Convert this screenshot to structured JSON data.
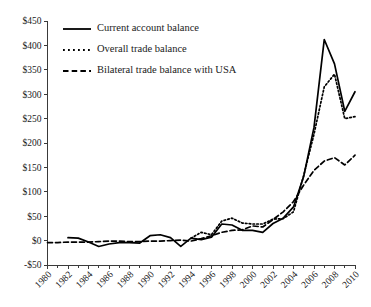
{
  "chart_data": {
    "type": "line",
    "title": "",
    "xlabel": "",
    "ylabel": "",
    "xlim": [
      1980,
      2010
    ],
    "ylim": [
      -50,
      450
    ],
    "grid": false,
    "legend_position": "top-left",
    "value_prefix": "$",
    "y_ticks": [
      -50,
      0,
      50,
      100,
      150,
      200,
      250,
      300,
      350,
      400,
      450
    ],
    "y_tick_labels": [
      "-$50",
      "$0",
      "$50",
      "$100",
      "$150",
      "$200",
      "$250",
      "$300",
      "$350",
      "$400",
      "$450"
    ],
    "x_ticks": [
      1980,
      1982,
      1984,
      1986,
      1988,
      1990,
      1992,
      1994,
      1996,
      1998,
      2000,
      2002,
      2004,
      2006,
      2008,
      2010
    ],
    "x_tick_labels": [
      "1980",
      "1982",
      "1984",
      "1986",
      "1988",
      "1990",
      "1992",
      "1994",
      "1996",
      "1998",
      "2000",
      "2002",
      "2004",
      "2006",
      "2008",
      "2010"
    ],
    "x_minor_ticks": [
      1981,
      1983,
      1985,
      1987,
      1989,
      1991,
      1993,
      1995,
      1997,
      1999,
      2001,
      2003,
      2005,
      2007,
      2009
    ],
    "x": [
      1980,
      1981,
      1982,
      1983,
      1984,
      1985,
      1986,
      1987,
      1988,
      1989,
      1990,
      1991,
      1992,
      1993,
      1994,
      1995,
      1996,
      1997,
      1998,
      1999,
      2000,
      2001,
      2002,
      2003,
      2004,
      2005,
      2006,
      2007,
      2008,
      2009,
      2010
    ],
    "series": [
      {
        "name": "Current account balance",
        "dash": "solid",
        "x_start": 1982,
        "values": [
          null,
          null,
          6,
          5,
          -3,
          -12,
          -7,
          -4,
          -4,
          -5,
          10,
          12,
          6,
          -12,
          5,
          2,
          7,
          34,
          32,
          21,
          21,
          17,
          35,
          46,
          69,
          132,
          232,
          412,
          362,
          265,
          305
        ]
      },
      {
        "name": "Overall trade balance",
        "dash": "dotted",
        "x_start": 1994,
        "values": [
          null,
          null,
          null,
          null,
          null,
          null,
          null,
          null,
          null,
          null,
          null,
          null,
          null,
          null,
          5,
          17,
          12,
          40,
          46,
          36,
          34,
          34,
          44,
          45,
          59,
          134,
          218,
          315,
          341,
          250,
          254
        ]
      },
      {
        "name": "Bilateral trade balance with USA",
        "dash": "dashed",
        "x_start": 1980,
        "values": [
          -4,
          -4,
          -3,
          -3,
          -3,
          -2,
          -1,
          -1,
          -2,
          -2,
          -1,
          -1,
          0,
          1,
          -1,
          4,
          10,
          17,
          21,
          22,
          30,
          28,
          43,
          59,
          80,
          114,
          144,
          163,
          170,
          155,
          175
        ]
      }
    ]
  },
  "legend": {
    "items": [
      {
        "label": "Current account balance",
        "style": "solid"
      },
      {
        "label": "Overall trade balance",
        "style": "dotted"
      },
      {
        "label": "Bilateral trade balance with USA",
        "style": "dashed"
      }
    ]
  }
}
